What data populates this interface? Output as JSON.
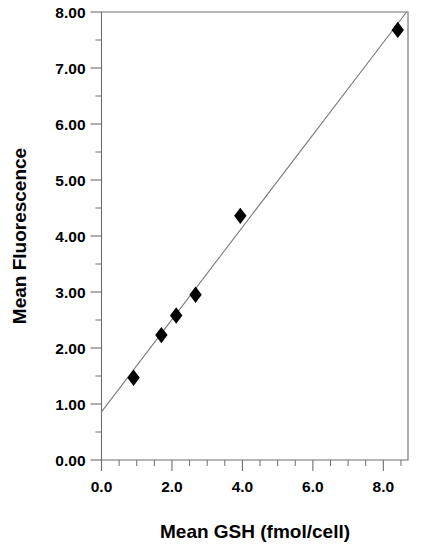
{
  "chart_data": {
    "type": "scatter",
    "title": "",
    "xlabel": "Mean  GSH  (fmol/cell)",
    "ylabel": "Mean  Fluorescence",
    "xlim": [
      0.0,
      8.7
    ],
    "ylim": [
      0.0,
      8.0
    ],
    "grid": false,
    "legend": null,
    "x_tick_labels": [
      "0.0",
      "2.0",
      "4.0",
      "6.0",
      "8.0"
    ],
    "x_tick_values": [
      0.0,
      2.0,
      4.0,
      6.0,
      8.0
    ],
    "x_minor_step": 0.5,
    "y_tick_labels": [
      "0.00",
      "1.00",
      "2.00",
      "3.00",
      "4.00",
      "5.00",
      "6.00",
      "7.00",
      "8.00"
    ],
    "y_tick_values": [
      0.0,
      1.0,
      2.0,
      3.0,
      4.0,
      5.0,
      6.0,
      7.0,
      8.0
    ],
    "y_minor_step": 0.5,
    "marker": "filled-diamond",
    "marker_color": "#000000",
    "line_color": "#7a7a7a",
    "frame_color": "#6e6e6e",
    "series": [
      {
        "name": "Mean Fluorescence",
        "points": [
          {
            "x": 0.91,
            "y": 1.47
          },
          {
            "x": 1.7,
            "y": 2.23
          },
          {
            "x": 2.12,
            "y": 2.58
          },
          {
            "x": 2.67,
            "y": 2.95
          },
          {
            "x": 3.94,
            "y": 4.36
          },
          {
            "x": 8.41,
            "y": 7.68
          }
        ]
      }
    ],
    "fit_line": {
      "name": "linear-regression",
      "x_start": 0.0,
      "y_start": 0.86,
      "x_end": 8.66,
      "y_end": 8.0
    }
  }
}
